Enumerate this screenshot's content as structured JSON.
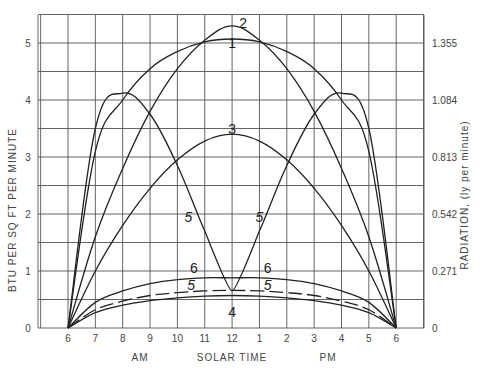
{
  "chart_data": {
    "type": "line",
    "title": "",
    "xlabel": "SOLAR TIME",
    "xlabel_am": "AM",
    "xlabel_pm": "PM",
    "ylabel": "BTU PER SQ FT PER MINUTE",
    "ylabel_right": "RADIATION, (ly per minute)",
    "x_ticks": [
      "6",
      "7",
      "8",
      "9",
      "10",
      "11",
      "12",
      "1",
      "2",
      "3",
      "4",
      "5",
      "6"
    ],
    "y_ticks": [
      "0",
      "1",
      "2",
      "3",
      "4",
      "5"
    ],
    "y_right_ticks": [
      "0",
      "0.271",
      "0.542",
      "0.813",
      "1.084",
      "1.355"
    ],
    "ylim": [
      0,
      5.5
    ],
    "grid": true,
    "x_hours": [
      6,
      7,
      8,
      9,
      10,
      11,
      12,
      13,
      14,
      15,
      16,
      17,
      18
    ],
    "series": [
      {
        "name": "1",
        "style": "solid",
        "values": [
          0,
          3.1,
          4.0,
          4.55,
          4.85,
          5.02,
          5.07,
          5.02,
          4.85,
          4.55,
          4.0,
          3.1,
          0
        ]
      },
      {
        "name": "2",
        "style": "solid",
        "values": [
          0,
          1.6,
          2.8,
          3.8,
          4.55,
          5.05,
          5.3,
          5.05,
          4.55,
          3.8,
          2.8,
          1.6,
          0
        ]
      },
      {
        "name": "3",
        "style": "solid",
        "values": [
          0,
          1.0,
          1.8,
          2.45,
          2.95,
          3.28,
          3.4,
          3.28,
          2.95,
          2.45,
          1.8,
          1.0,
          0
        ]
      },
      {
        "name": "5 (east/west)",
        "style": "solid",
        "values": [
          0,
          3.5,
          4.12,
          3.75,
          2.85,
          1.7,
          0.65,
          1.7,
          2.85,
          3.75,
          4.12,
          3.5,
          0
        ]
      },
      {
        "name": "6",
        "style": "solid",
        "values": [
          0,
          0.45,
          0.65,
          0.78,
          0.85,
          0.88,
          0.88,
          0.88,
          0.85,
          0.78,
          0.65,
          0.45,
          0
        ]
      },
      {
        "name": "5",
        "style": "dashed",
        "values": [
          0,
          0.32,
          0.47,
          0.57,
          0.62,
          0.65,
          0.66,
          0.65,
          0.62,
          0.57,
          0.47,
          0.32,
          0
        ]
      },
      {
        "name": "4",
        "style": "solid",
        "values": [
          0,
          0.27,
          0.4,
          0.48,
          0.53,
          0.56,
          0.57,
          0.56,
          0.53,
          0.48,
          0.4,
          0.27,
          0
        ]
      }
    ],
    "annotations": [
      {
        "text": "1",
        "x": 12,
        "y": 5.0
      },
      {
        "text": "2",
        "x": 12.4,
        "y": 5.35
      },
      {
        "text": "3",
        "x": 12,
        "y": 3.5
      },
      {
        "text": "5",
        "x": 10.4,
        "y": 1.95
      },
      {
        "text": "5",
        "x": 13.0,
        "y": 1.95
      },
      {
        "text": "6",
        "x": 10.6,
        "y": 1.05
      },
      {
        "text": "6",
        "x": 13.3,
        "y": 1.05
      },
      {
        "text": "5",
        "x": 10.5,
        "y": 0.75
      },
      {
        "text": "5",
        "x": 13.3,
        "y": 0.75
      },
      {
        "text": "4",
        "x": 12,
        "y": 0.28
      }
    ]
  }
}
